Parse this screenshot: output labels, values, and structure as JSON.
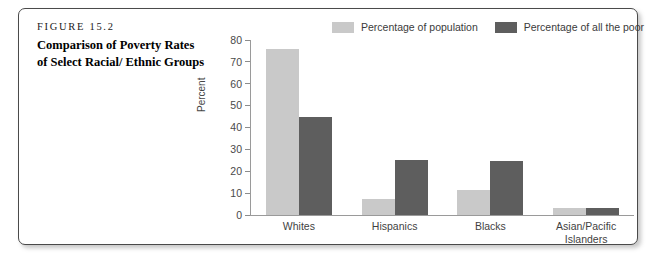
{
  "figure": {
    "eyebrow": "FIGURE 15.2",
    "title": "Comparison of Poverty Rates of Select Racial/ Ethnic Groups"
  },
  "colors": {
    "light_bar": "#c9c9c9",
    "dark_bar": "#5e5e5e",
    "axis": "#9a9a9a",
    "frame": "#4a4a4a"
  },
  "chart_data": {
    "type": "bar",
    "title": "Comparison of Poverty Rates of Select Racial/ Ethnic Groups",
    "xlabel": "",
    "ylabel": "Percent",
    "ylim": [
      0,
      80
    ],
    "yticks": [
      0,
      10,
      20,
      30,
      40,
      50,
      60,
      70,
      80
    ],
    "ytick_labels": [
      "0",
      "10",
      "20",
      "30",
      "40",
      "50",
      "60",
      "70",
      "80"
    ],
    "grid": false,
    "legend_position": "top-right",
    "categories": [
      "Whites",
      "Hispanics",
      "Blacks",
      "Asian/Pacific Islanders"
    ],
    "category_lines": [
      [
        "Whites"
      ],
      [
        "Hispanics"
      ],
      [
        "Blacks"
      ],
      [
        "Asian/Pacific",
        "Islanders"
      ]
    ],
    "series": [
      {
        "name": "Percentage of population",
        "color": "#c9c9c9",
        "values": [
          76,
          7.5,
          11.5,
          3
        ]
      },
      {
        "name": "Percentage of all the poor",
        "color": "#5e5e5e",
        "values": [
          45,
          25,
          24.5,
          3
        ]
      }
    ]
  }
}
